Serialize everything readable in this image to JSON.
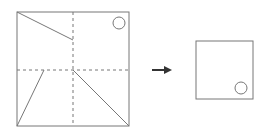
{
  "diagram": {
    "type": "paper-folding-puzzle",
    "colors": {
      "line": "#777777",
      "arrow": "#333333",
      "background": "#ffffff"
    },
    "left_figure": {
      "label": "unfolded paper with fold lines and cut lines",
      "square": {
        "x": 17,
        "y": 12,
        "w": 112,
        "h": 114
      },
      "fold_lines": [
        {
          "x1": 73,
          "y1": 12,
          "x2": 73,
          "y2": 126
        },
        {
          "x1": 17,
          "y1": 70,
          "x2": 129,
          "y2": 70
        }
      ],
      "cut_lines": [
        {
          "x1": 17,
          "y1": 12,
          "x2": 73,
          "y2": 40
        },
        {
          "x1": 44,
          "y1": 70,
          "x2": 17,
          "y2": 126
        },
        {
          "x1": 73,
          "y1": 70,
          "x2": 129,
          "y2": 126
        }
      ],
      "hole": {
        "cx": 119,
        "cy": 23,
        "r": 6
      }
    },
    "arrow": {
      "x1": 152,
      "y1": 70,
      "x2": 172,
      "y2": 70,
      "icon": "right-arrow-icon"
    },
    "right_figure": {
      "label": "folded paper",
      "square": {
        "x": 196,
        "y": 41,
        "w": 57,
        "h": 58
      },
      "hole": {
        "cx": 241,
        "cy": 88,
        "r": 6
      }
    }
  }
}
